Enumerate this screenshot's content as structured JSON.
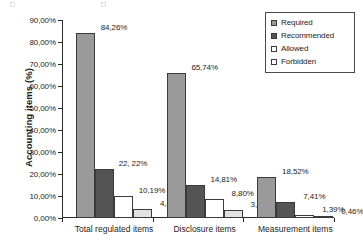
{
  "chart_data": {
    "type": "bar",
    "title": "",
    "xlabel": "",
    "ylabel": "Accounting items (%)",
    "categories": [
      "Total regulated items",
      "Disclosure items",
      "Measurement items"
    ],
    "series": [
      {
        "name": "Required",
        "color": "#9a9a9a",
        "values": [
          84.26,
          65.74,
          18.52
        ],
        "labels": [
          "84,26%",
          "65,74%",
          "18,52%"
        ]
      },
      {
        "name": "Recommended",
        "color": "#555555",
        "values": [
          22.22,
          14.81,
          7.41
        ],
        "labels": [
          "22, 22%",
          "14,81%",
          "7,41%"
        ]
      },
      {
        "name": "Allowed",
        "color": "#ffffff",
        "values": [
          10.19,
          8.8,
          1.39
        ],
        "labels": [
          "10,19%",
          "8,80%",
          "1,39%"
        ]
      },
      {
        "name": "Forbidden",
        "color": "#e2e2e2",
        "values": [
          4.17,
          3.7,
          0.46
        ],
        "labels": [
          "4,17%",
          "3,70%",
          "0,46%"
        ]
      }
    ],
    "ylim": [
      0,
      90
    ],
    "ytick_values": [
      0,
      10,
      20,
      30,
      40,
      50,
      60,
      70,
      80,
      90
    ],
    "ytick_labels": [
      "0,00%",
      "10,00%",
      "20,00%",
      "30,00%",
      "40,00%",
      "50,00%",
      "60,00%",
      "70,00%",
      "80,00%",
      "90,00%"
    ],
    "grid": false,
    "legend_position": "top-right",
    "legend_entries": [
      "Required",
      "Recommended",
      "Allowed",
      "Forbidden"
    ]
  }
}
